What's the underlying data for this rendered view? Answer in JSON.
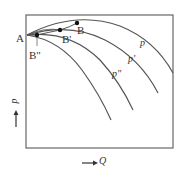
{
  "diagram": {
    "type": "pump-characteristic-curves",
    "box": {
      "left": 26,
      "top": 15,
      "right": 173,
      "bottom": 148
    },
    "colors": {
      "line": "#555555",
      "text": "#333333",
      "point": "#111111"
    },
    "points": {
      "A": {
        "label": "A"
      },
      "B": {
        "label": "B"
      },
      "B1": {
        "label": "B'"
      },
      "B2": {
        "label": "B\""
      }
    },
    "curves": [
      {
        "label": "p"
      },
      {
        "label": "p'"
      },
      {
        "label": "p\""
      },
      {
        "label": ""
      }
    ],
    "axes": {
      "y": {
        "label": "p",
        "arrow": "up"
      },
      "x": {
        "label": "Q",
        "arrow": "right"
      }
    }
  }
}
